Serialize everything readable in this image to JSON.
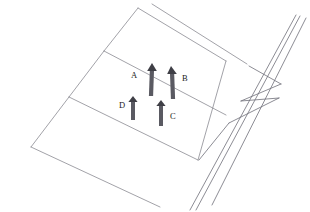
{
  "figure": {
    "background_color": "#ffffff",
    "line_color": "#8a8a92",
    "line_color_dark": "#6f6f78",
    "marker_color": "#5a5a62",
    "marker_color_dark": "#3f3f46",
    "label_color": "#1a1a1a"
  },
  "markers": [
    {
      "id": "A",
      "label": "A",
      "label_x": 131,
      "label_y": 71,
      "shaft_top_x": 152,
      "shaft_top_y": 68,
      "shaft_bottom_x": 151,
      "shaft_bottom_y": 96,
      "head_tip_x": 152,
      "head_tip_y": 63,
      "direction": "up",
      "width": 4.2
    },
    {
      "id": "B",
      "label": "B",
      "label_x": 182,
      "label_y": 74,
      "shaft_top_x": 172,
      "shaft_top_y": 71,
      "shaft_bottom_x": 173,
      "shaft_bottom_y": 99,
      "head_tip_x": 171,
      "head_tip_y": 66,
      "direction": "up",
      "width": 4.2
    },
    {
      "id": "C",
      "label": "C",
      "label_x": 170,
      "label_y": 112,
      "shaft_top_x": 161,
      "shaft_top_y": 103,
      "shaft_bottom_x": 161,
      "shaft_bottom_y": 126,
      "head_tip_x": 161,
      "head_tip_y": 100,
      "direction": "up",
      "width": 4.0
    },
    {
      "id": "D",
      "label": "D",
      "label_x": 119,
      "label_y": 101,
      "shaft_top_x": 133,
      "shaft_top_y": 99,
      "shaft_bottom_x": 133,
      "shaft_bottom_y": 120,
      "head_tip_x": 133,
      "head_tip_y": 96,
      "direction": "up",
      "width": 4.0
    }
  ],
  "geometry": {
    "surface_edges": [
      {
        "name": "left-outer-edge-upper",
        "x1": 138,
        "y1": 8,
        "x2": 104,
        "y2": 51
      },
      {
        "name": "left-outer-edge-lower",
        "x1": 104,
        "y1": 51,
        "x2": 69,
        "y2": 97
      },
      {
        "name": "left-outer-edge-foot",
        "x1": 69,
        "y1": 97,
        "x2": 31,
        "y2": 147
      },
      {
        "name": "top-front-edge",
        "x1": 138,
        "y1": 8,
        "x2": 226,
        "y2": 61
      },
      {
        "name": "top-back-edge",
        "x1": 152,
        "y1": 4,
        "x2": 247,
        "y2": 64
      },
      {
        "name": "lane-divider-upper",
        "x1": 104,
        "y1": 51,
        "x2": 226,
        "y2": 115
      },
      {
        "name": "lane-divider-lower",
        "x1": 69,
        "y1": 97,
        "x2": 198,
        "y2": 160
      },
      {
        "name": "bottom-front-edge",
        "x1": 31,
        "y1": 147,
        "x2": 160,
        "y2": 207
      },
      {
        "name": "right-inner-rail",
        "x1": 226,
        "y1": 61,
        "x2": 198,
        "y2": 160
      }
    ],
    "barrier_lines": [
      {
        "name": "barrier-rail-outer",
        "x1": 306,
        "y1": 18,
        "x2": 212,
        "y2": 205
      },
      {
        "name": "barrier-rail-mid",
        "x1": 300,
        "y1": 16,
        "x2": 196,
        "y2": 210
      },
      {
        "name": "barrier-rail-inner",
        "x1": 296,
        "y1": 15,
        "x2": 190,
        "y2": 210
      },
      {
        "name": "barrier-post-upper",
        "x1": 249,
        "y1": 66,
        "x2": 281,
        "y2": 84
      },
      {
        "name": "barrier-brace-upper",
        "x1": 281,
        "y1": 84,
        "x2": 241,
        "y2": 101
      },
      {
        "name": "barrier-post-lower",
        "x1": 241,
        "y1": 101,
        "x2": 279,
        "y2": 98
      },
      {
        "name": "barrier-brace-lower",
        "x1": 279,
        "y1": 98,
        "x2": 229,
        "y2": 123
      },
      {
        "name": "barrier-foot-line",
        "x1": 229,
        "y1": 123,
        "x2": 199,
        "y2": 160
      }
    ]
  }
}
